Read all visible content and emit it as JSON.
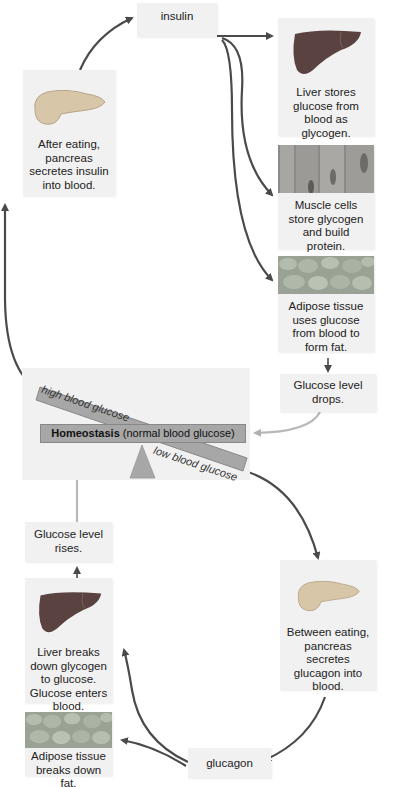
{
  "colors": {
    "box_bg": "#f1f1f1",
    "arrow_dark": "#4a4a4a",
    "arrow_light": "#b8b8b8",
    "bar_gray": "#a7a7a7",
    "liver": "#5a4240",
    "pancreas": "#d8c6a8"
  },
  "top_cycle": {
    "pancreas_box": {
      "text": "After eating, pancreas secretes insulin into blood.",
      "icon": "pancreas-icon"
    },
    "insulin_label": "insulin",
    "liver_box": {
      "text": "Liver stores glucose from blood as glycogen.",
      "icon": "liver-icon"
    },
    "muscle_box": {
      "text": "Muscle cells store glycogen and build protein.",
      "icon": "muscle-cells-icon"
    },
    "adipose_box": {
      "text": "Adipose tissue uses glucose from blood to form fat.",
      "icon": "adipose-tissue-icon"
    },
    "result_box": {
      "text": "Glucose level drops."
    }
  },
  "homeostasis": {
    "high_label": "high blood glucose",
    "low_label": "low blood glucose",
    "bar_bold": "Homeostasis",
    "bar_rest": " (normal blood glucose)"
  },
  "bottom_cycle": {
    "result_box": {
      "text": "Glucose level rises."
    },
    "liver_box": {
      "text": "Liver breaks down glycogen to glucose. Glucose enters blood.",
      "icon": "liver-icon"
    },
    "adipose_box": {
      "text": "Adipose tissue breaks down fat.",
      "icon": "adipose-tissue-icon"
    },
    "glucagon_label": "glucagon",
    "pancreas_box": {
      "text": "Between eating, pancreas secretes glucagon into blood.",
      "icon": "pancreas-icon"
    }
  }
}
